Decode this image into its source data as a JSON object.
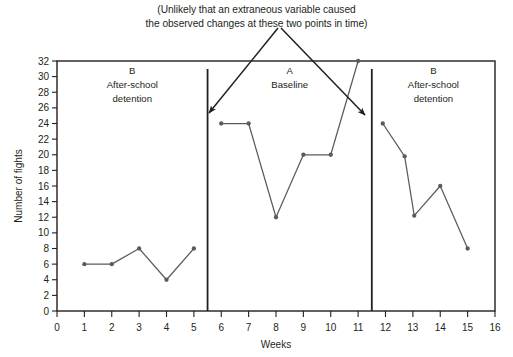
{
  "annotation": {
    "line1": "(Unlikely that an extraneous variable caused",
    "line2": "the observed changes at these two points in time)",
    "arrows": [
      {
        "name": "arrow-left",
        "from": [
          278,
          28
        ],
        "to": [
          209,
          113
        ]
      },
      {
        "name": "arrow-right",
        "from": [
          281,
          28
        ],
        "to": [
          365,
          115
        ]
      }
    ]
  },
  "chart_data": {
    "type": "line",
    "title": "",
    "xlabel": "Weeks",
    "ylabel": "Number of fights",
    "xlim": [
      0,
      16
    ],
    "ylim": [
      0,
      32
    ],
    "xticks": [
      0,
      1,
      2,
      3,
      4,
      5,
      6,
      7,
      8,
      9,
      10,
      11,
      12,
      13,
      14,
      15,
      16
    ],
    "yticks": [
      0,
      2,
      4,
      6,
      8,
      10,
      12,
      14,
      16,
      18,
      20,
      22,
      24,
      26,
      28,
      30,
      32
    ],
    "grid": false,
    "legend": "none",
    "marker": "circle",
    "line_color": "#5b5b5b",
    "phase_dividers": [
      5.5,
      11.5
    ],
    "phases": [
      {
        "id": "phase-b1",
        "letter": "B",
        "name_line1": "After-school",
        "name_line2": "detention",
        "x": [
          1,
          2,
          3,
          4,
          5
        ],
        "values": [
          6,
          6,
          8,
          4,
          8
        ]
      },
      {
        "id": "phase-a",
        "letter": "A",
        "name_line1": "Baseline",
        "name_line2": "",
        "x": [
          6,
          7,
          8,
          9,
          10,
          11
        ],
        "values": [
          24,
          24,
          12,
          20,
          20,
          32
        ]
      },
      {
        "id": "phase-b2",
        "letter": "B",
        "name_line1": "After-school",
        "name_line2": "detention",
        "x": [
          11.9,
          12.7,
          13.05,
          14,
          15
        ],
        "values": [
          24,
          19.8,
          12.2,
          16,
          8
        ]
      }
    ]
  }
}
